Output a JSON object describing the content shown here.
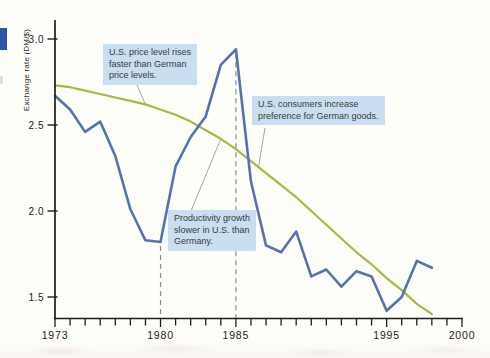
{
  "figure": {
    "y_axis_label": "Exchange rate (DM/$)"
  },
  "chart_data": {
    "type": "line",
    "title": "",
    "xlabel": "",
    "ylabel": "Exchange rate (DM/$)",
    "xlim": [
      1973,
      2000
    ],
    "ylim": [
      1.35,
      3.05
    ],
    "grid": false,
    "legend": "none",
    "yticks": [
      {
        "value": 3.0,
        "label": "3.0"
      },
      {
        "value": 2.5,
        "label": "2.5"
      },
      {
        "value": 2.0,
        "label": "2.0"
      },
      {
        "value": 1.5,
        "label": "1.5"
      }
    ],
    "xticks": [
      {
        "year": 1973,
        "label": "1973"
      },
      {
        "year": 1980,
        "label": "1980"
      },
      {
        "year": 1985,
        "label": "1985"
      },
      {
        "year": 1995,
        "label": "1995"
      },
      {
        "year": 2000,
        "label": "2000"
      }
    ],
    "minor_xticks_every_year": true,
    "x": [
      1973,
      1974,
      1975,
      1976,
      1977,
      1978,
      1979,
      1980,
      1981,
      1982,
      1983,
      1984,
      1985,
      1986,
      1987,
      1988,
      1989,
      1990,
      1991,
      1992,
      1993,
      1994,
      1995,
      1996,
      1997,
      1998
    ],
    "series": [
      {
        "name": "actual-exchange-rate-DM-per-USD",
        "color": "#5571b3",
        "values": [
          2.67,
          2.59,
          2.46,
          2.52,
          2.32,
          2.01,
          1.83,
          1.82,
          2.26,
          2.43,
          2.55,
          2.85,
          2.94,
          2.17,
          1.8,
          1.76,
          1.88,
          1.62,
          1.66,
          1.56,
          1.65,
          1.62,
          1.42,
          1.5,
          1.71,
          1.67
        ]
      },
      {
        "name": "trend-exchange-rate",
        "color": "#a9b93e",
        "values": [
          2.73,
          2.72,
          2.7,
          2.68,
          2.66,
          2.64,
          2.62,
          2.59,
          2.56,
          2.52,
          2.47,
          2.42,
          2.36,
          2.29,
          2.22,
          2.15,
          2.08,
          2.0,
          1.92,
          1.84,
          1.76,
          1.69,
          1.61,
          1.54,
          1.46,
          1.4
        ]
      }
    ],
    "dashed_vlines": [
      {
        "year": 1980,
        "top_value": 1.82
      },
      {
        "year": 1985,
        "top_value": 2.94
      }
    ],
    "annotations": [
      {
        "lines": [
          "U.S. price level rises",
          "faster than German",
          "price levels."
        ],
        "anchor_year": 1979,
        "anchor_series": "trend-exchange-rate"
      },
      {
        "lines": [
          "U.S. consumers increase",
          "preference for German goods."
        ],
        "anchor_year": 1986.5,
        "anchor_series": "trend-exchange-rate"
      },
      {
        "lines": [
          "Productivity growth",
          "slower in U.S. than",
          "Germany."
        ],
        "anchor_year": 1984,
        "anchor_series": "trend-exchange-rate"
      }
    ],
    "colors": {
      "actual_line": "#5571b3",
      "trend_line": "#a9b93e",
      "callout_background": "#c9def1",
      "dashed_line": "#8c8c8c",
      "axis": "#1c1c1c",
      "page_edge_marker": "#2d54a7"
    }
  }
}
